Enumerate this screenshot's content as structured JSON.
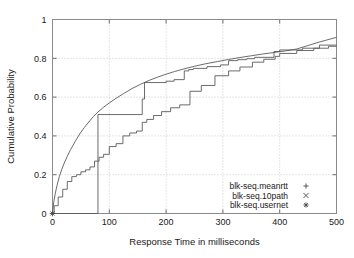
{
  "chart_data": {
    "type": "line",
    "title": "",
    "subtitle": "",
    "xlabel": "Response Time in milliseconds",
    "ylabel": "Cumulative Probability",
    "xlim": [
      0,
      500
    ],
    "ylim": [
      0,
      1
    ],
    "xticks": [
      "0",
      "100",
      "200",
      "300",
      "400",
      "500"
    ],
    "xtick_values": [
      0,
      100,
      200,
      300,
      400,
      500
    ],
    "yticks": [
      "0",
      "0.2",
      "0.4",
      "0.6",
      "0.8",
      "1"
    ],
    "ytick_values": [
      0,
      0.2,
      0.4,
      0.6,
      0.8,
      1
    ],
    "grid": true,
    "legend_position": "bottom-right",
    "line_color": "#5a5a5a",
    "grid_color": "#b4b4b4",
    "frame_color": "#8a8a8a",
    "series": [
      {
        "name": "blk-seq.meanrtt",
        "marker": "+",
        "style": "smooth",
        "x": [
          0,
          2,
          5,
          8,
          12,
          16,
          20,
          26,
          32,
          40,
          48,
          56,
          64,
          72,
          80,
          90,
          100,
          112,
          125,
          140,
          155,
          170,
          185,
          200,
          215,
          230,
          250,
          270,
          290,
          310,
          330,
          350,
          370,
          390,
          410,
          430,
          450,
          470,
          490,
          500
        ],
        "y": [
          0.0,
          0.055,
          0.105,
          0.145,
          0.19,
          0.225,
          0.255,
          0.295,
          0.33,
          0.372,
          0.41,
          0.443,
          0.472,
          0.5,
          0.523,
          0.548,
          0.57,
          0.594,
          0.618,
          0.644,
          0.666,
          0.686,
          0.703,
          0.718,
          0.732,
          0.744,
          0.759,
          0.772,
          0.783,
          0.794,
          0.804,
          0.813,
          0.822,
          0.83,
          0.838,
          0.848,
          0.866,
          0.884,
          0.9,
          0.908
        ]
      },
      {
        "name": "blk-seq.10path",
        "marker": "x",
        "style": "step",
        "x": [
          0,
          3,
          3,
          10,
          10,
          18,
          18,
          26,
          26,
          34,
          34,
          42,
          42,
          50,
          50,
          58,
          58,
          66,
          66,
          74,
          74,
          82,
          82,
          90,
          90,
          100,
          100,
          112,
          112,
          124,
          124,
          136,
          136,
          148,
          148,
          158,
          158,
          166,
          166,
          178,
          178,
          192,
          192,
          208,
          208,
          224,
          224,
          242,
          242,
          262,
          262,
          286,
          286,
          310,
          310,
          330,
          330,
          352,
          352,
          372,
          372,
          392,
          392,
          400,
          400,
          430,
          430,
          460,
          460,
          486,
          486,
          500
        ],
        "y": [
          0.0,
          0.0,
          0.04,
          0.04,
          0.085,
          0.085,
          0.125,
          0.125,
          0.165,
          0.165,
          0.19,
          0.19,
          0.2,
          0.2,
          0.215,
          0.215,
          0.225,
          0.225,
          0.24,
          0.24,
          0.27,
          0.27,
          0.29,
          0.29,
          0.305,
          0.305,
          0.345,
          0.345,
          0.36,
          0.36,
          0.4,
          0.4,
          0.415,
          0.415,
          0.425,
          0.425,
          0.47,
          0.47,
          0.485,
          0.485,
          0.505,
          0.505,
          0.525,
          0.525,
          0.545,
          0.545,
          0.56,
          0.56,
          0.63,
          0.63,
          0.66,
          0.66,
          0.71,
          0.71,
          0.735,
          0.735,
          0.755,
          0.755,
          0.78,
          0.78,
          0.795,
          0.795,
          0.81,
          0.81,
          0.825,
          0.825,
          0.84,
          0.84,
          0.852,
          0.852,
          0.862,
          0.862
        ]
      },
      {
        "name": "blk-seq.usernet",
        "marker": "*",
        "style": "step",
        "x": [
          0,
          80,
          80,
          158,
          158,
          162,
          162,
          200,
          200,
          214,
          214,
          232,
          232,
          240,
          240,
          248,
          248,
          272,
          272,
          296,
          296,
          310,
          310,
          326,
          326,
          342,
          342,
          356,
          356,
          390,
          390,
          400,
          400,
          440,
          440,
          470,
          470,
          500
        ],
        "y": [
          0.0,
          0.0,
          0.51,
          0.51,
          0.59,
          0.59,
          0.675,
          0.675,
          0.682,
          0.682,
          0.69,
          0.69,
          0.735,
          0.735,
          0.742,
          0.742,
          0.748,
          0.748,
          0.757,
          0.757,
          0.766,
          0.766,
          0.788,
          0.788,
          0.793,
          0.793,
          0.798,
          0.798,
          0.805,
          0.805,
          0.835,
          0.835,
          0.843,
          0.843,
          0.852,
          0.852,
          0.868,
          0.868
        ]
      }
    ],
    "origin_marker": {
      "x": 0,
      "y": 0,
      "symbol": "*"
    }
  },
  "legend": {
    "entries": [
      {
        "label": "blk-seq.meanrtt",
        "marker": "+"
      },
      {
        "label": "blk-seq.10path",
        "marker": "x"
      },
      {
        "label": "blk-seq.usernet",
        "marker": "*"
      }
    ]
  }
}
